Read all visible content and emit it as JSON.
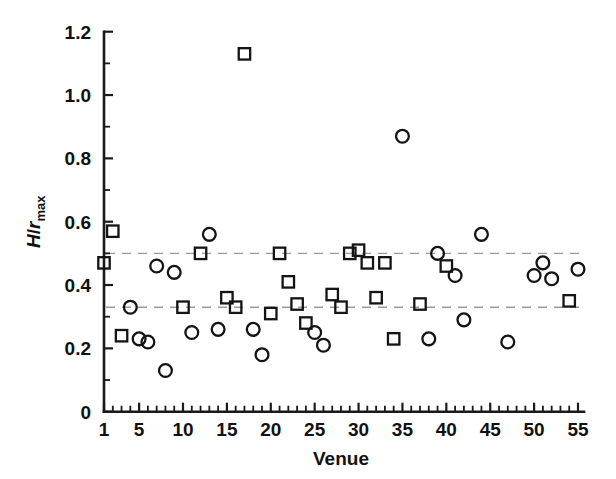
{
  "chart_data": {
    "type": "scatter",
    "title": "",
    "xlabel": "Venue",
    "ylabel": "H/r_max",
    "ylabel_parts": {
      "numerator": "H",
      "slash": "/",
      "denominator": "r",
      "subscript": "max"
    },
    "xlim": [
      1,
      55
    ],
    "ylim": [
      0,
      1.2
    ],
    "x_ticks": [
      1,
      5,
      10,
      15,
      20,
      25,
      30,
      35,
      40,
      45,
      50,
      55
    ],
    "x_tick_labels": [
      "1",
      "5",
      "10",
      "15",
      "20",
      "25",
      "30",
      "35",
      "40",
      "45",
      "50",
      "55"
    ],
    "x_minor_step": 1,
    "y_ticks": [
      0,
      0.2,
      0.4,
      0.6,
      0.8,
      1.0,
      1.2
    ],
    "y_tick_labels": [
      "0",
      "0.2",
      "0.4",
      "0.6",
      "0.8",
      "1.0",
      "1.2"
    ],
    "y_minor_step": 0.1,
    "grid": false,
    "legend": null,
    "reference_lines": [
      {
        "name": "upper-reference-line",
        "y": 0.5,
        "style": "dashed",
        "color": "#9a9a9a"
      },
      {
        "name": "lower-reference-line",
        "y": 0.33,
        "style": "dashed",
        "color": "#9a9a9a"
      }
    ],
    "series": [
      {
        "name": "squares",
        "marker": "square",
        "color": "#141414",
        "points": [
          {
            "x": 1,
            "y": 0.47
          },
          {
            "x": 2,
            "y": 0.57
          },
          {
            "x": 3,
            "y": 0.24
          },
          {
            "x": 10,
            "y": 0.33
          },
          {
            "x": 12,
            "y": 0.5
          },
          {
            "x": 15,
            "y": 0.36
          },
          {
            "x": 16,
            "y": 0.33
          },
          {
            "x": 17,
            "y": 1.13
          },
          {
            "x": 20,
            "y": 0.31
          },
          {
            "x": 21,
            "y": 0.5
          },
          {
            "x": 22,
            "y": 0.41
          },
          {
            "x": 23,
            "y": 0.34
          },
          {
            "x": 24,
            "y": 0.28
          },
          {
            "x": 27,
            "y": 0.37
          },
          {
            "x": 28,
            "y": 0.33
          },
          {
            "x": 29,
            "y": 0.5
          },
          {
            "x": 30,
            "y": 0.51
          },
          {
            "x": 31,
            "y": 0.47
          },
          {
            "x": 32,
            "y": 0.36
          },
          {
            "x": 33,
            "y": 0.47
          },
          {
            "x": 34,
            "y": 0.23
          },
          {
            "x": 37,
            "y": 0.34
          },
          {
            "x": 40,
            "y": 0.46
          },
          {
            "x": 54,
            "y": 0.35
          }
        ]
      },
      {
        "name": "circles",
        "marker": "circle",
        "color": "#141414",
        "points": [
          {
            "x": 4,
            "y": 0.33
          },
          {
            "x": 5,
            "y": 0.23
          },
          {
            "x": 6,
            "y": 0.22
          },
          {
            "x": 7,
            "y": 0.46
          },
          {
            "x": 8,
            "y": 0.13
          },
          {
            "x": 9,
            "y": 0.44
          },
          {
            "x": 11,
            "y": 0.25
          },
          {
            "x": 13,
            "y": 0.56
          },
          {
            "x": 14,
            "y": 0.26
          },
          {
            "x": 18,
            "y": 0.26
          },
          {
            "x": 19,
            "y": 0.18
          },
          {
            "x": 25,
            "y": 0.25
          },
          {
            "x": 26,
            "y": 0.21
          },
          {
            "x": 35,
            "y": 0.87
          },
          {
            "x": 38,
            "y": 0.23
          },
          {
            "x": 39,
            "y": 0.5
          },
          {
            "x": 41,
            "y": 0.43
          },
          {
            "x": 42,
            "y": 0.29
          },
          {
            "x": 44,
            "y": 0.56
          },
          {
            "x": 47,
            "y": 0.22
          },
          {
            "x": 50,
            "y": 0.43
          },
          {
            "x": 51,
            "y": 0.47
          },
          {
            "x": 52,
            "y": 0.42
          },
          {
            "x": 55,
            "y": 0.45
          }
        ]
      }
    ]
  }
}
